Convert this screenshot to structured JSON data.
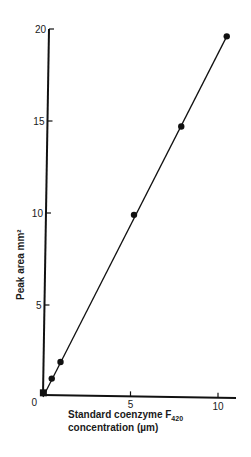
{
  "chart_data": {
    "type": "scatter",
    "title": "",
    "xlabel": "Standard coenzyme F420 concentration (µm)",
    "xlabel_line1": "Standard coenzyme F",
    "xlabel_subscript": "420",
    "xlabel_line2": "concentration (µm)",
    "ylabel": "Peak area mm²",
    "xlim": [
      0,
      11
    ],
    "ylim": [
      0,
      20
    ],
    "xticks": [
      0,
      5,
      10
    ],
    "yticks": [
      0,
      5,
      10,
      15,
      20
    ],
    "grid": false,
    "legend": null,
    "series": [
      {
        "name": "Standard coenzyme F420",
        "marker": "filled-circle",
        "line": "linear-fit",
        "x": [
          0.05,
          0.5,
          1.0,
          5.2,
          7.9,
          10.5
        ],
        "y": [
          0.2,
          1.0,
          1.9,
          9.9,
          14.7,
          19.6
        ]
      }
    ],
    "fit_line": {
      "x0": 0,
      "y0": 0,
      "x1": 10.5,
      "y1": 19.6
    }
  },
  "axes": {
    "x_tick_labels": [
      "0",
      "5",
      "10"
    ],
    "y_tick_labels": [
      "0",
      "5",
      "10",
      "15",
      "20"
    ]
  }
}
